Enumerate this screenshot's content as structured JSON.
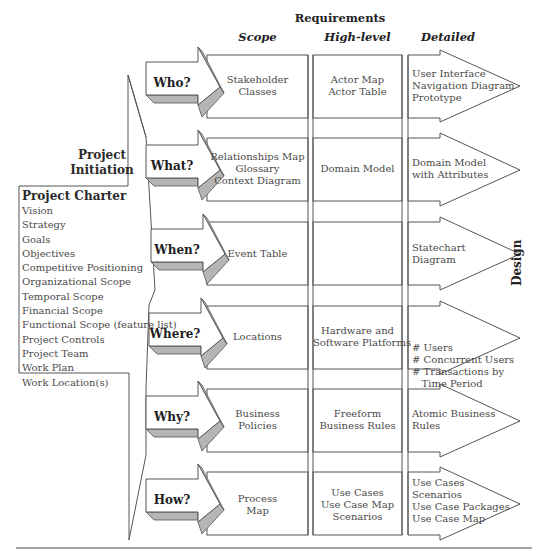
{
  "headers": {
    "requirements": "Requirements",
    "scope": "Scope",
    "high_level": "High-level",
    "detailed": "Detailed",
    "design": "Design"
  },
  "project_initiation": {
    "title_line1": "Project",
    "title_line2": "Initiation",
    "charter_title": "Project Charter",
    "items": [
      "Vision",
      "Strategy",
      "Goals",
      "Objectives",
      "Competitive Positioning",
      "Organizational Scope",
      "Temporal Scope",
      "Financial Scope",
      "Functional Scope (feature list)",
      "Project Controls",
      "Project Team",
      "Work Plan",
      "Work Location(s)"
    ]
  },
  "rows": [
    {
      "question": "Who?",
      "scope": [
        "Stakeholder",
        "Classes"
      ],
      "high_level": [
        "Actor Map",
        "Actor Table"
      ],
      "detailed": [
        "User Interface",
        "Navigation Diagram",
        "Prototype"
      ]
    },
    {
      "question": "What?",
      "scope": [
        "Relationships Map",
        "Glossary",
        "Context Diagram"
      ],
      "high_level": [
        "Domain Model"
      ],
      "detailed": [
        "Domain Model",
        "with Attributes"
      ]
    },
    {
      "question": "When?",
      "scope": [
        "Event Table"
      ],
      "high_level": [],
      "detailed": [
        "Statechart",
        "Diagram"
      ]
    },
    {
      "question": "Where?",
      "scope": [
        "Locations"
      ],
      "high_level": [
        "Hardware and",
        "Software Platforms"
      ],
      "detailed": [
        "# Users",
        "# Concurrent Users",
        "# Transactions by",
        "   Time Period"
      ]
    },
    {
      "question": "Why?",
      "scope": [
        "Business",
        "Policies"
      ],
      "high_level": [
        "Freeform",
        "Business Rules"
      ],
      "detailed": [
        "Atomic Business",
        "Rules"
      ]
    },
    {
      "question": "How?",
      "scope": [
        "Process",
        "Map"
      ],
      "high_level": [
        "Use Cases",
        "Use Case Map",
        "Scenarios"
      ],
      "detailed": [
        "Use Cases",
        "Scenarios",
        "Use Case Packages",
        "Use Case Map"
      ]
    }
  ],
  "colors": {
    "line": "#555555",
    "shadow_fill": "#b5b5b5",
    "text": "#4a4a4a"
  }
}
